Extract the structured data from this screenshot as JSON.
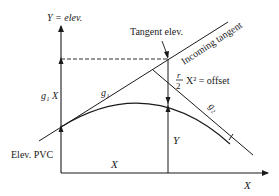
{
  "diagram": {
    "labels": {
      "y_axis": "Y = elev.",
      "tangent_elev": "Tangent elev.",
      "incoming_tangent": "Incoming tangent",
      "offset_frac_num": "r",
      "offset_frac_den": "2",
      "offset_rest": "X² = offset",
      "g1x": "g₁ X",
      "g1": "g₁",
      "g2": "g₂",
      "elev_pvc": "Elev. PVC",
      "x_bottom": "X",
      "x_right": "X",
      "y_vertical": "Y"
    },
    "colors": {
      "line": "#1a1a1a",
      "background": "#ffffff"
    }
  }
}
